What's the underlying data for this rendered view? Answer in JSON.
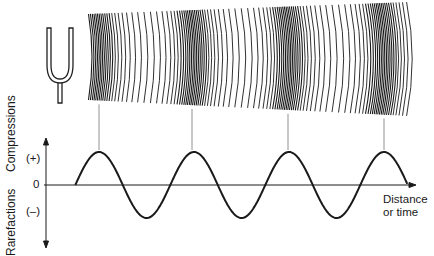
{
  "diagram": {
    "source_icon": "tuning-fork-icon",
    "axis": {
      "y_label_top": "Compressions",
      "y_label_bottom": "Rarefactions",
      "plus": "(+)",
      "zero": "0",
      "minus": "(–)",
      "x_label_line1": "Distance",
      "x_label_line2": "or time"
    },
    "compression_x": [
      99,
      192,
      288,
      384
    ],
    "colors": {
      "ink": "#1a1a1a",
      "guide": "#777777"
    }
  }
}
